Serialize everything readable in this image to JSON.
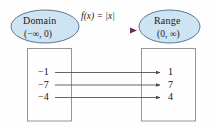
{
  "figure": {
    "type": "function-mapping-diagram",
    "background_color": "#fefefe",
    "domain_ellipse": {
      "title": "Domain",
      "interval": "(−∞, 0)",
      "fill_color": "#cfe4f3",
      "stroke_color": "#4a6a86"
    },
    "range_ellipse": {
      "title": "Range",
      "interval": "(0, ∞)",
      "fill_color": "#cfe4f3",
      "stroke_color": "#4a6a86"
    },
    "function_label": "f(x) = |x|",
    "function_label_parts": {
      "f": "f",
      "open_paren": "(",
      "variable": "x",
      "close_paren": ")",
      "equals": "=",
      "abs": "|x|"
    },
    "top_connector": {
      "from": "Domain",
      "to": "Range",
      "start_color": "#bcdcc0",
      "end_color": "#6b3050"
    },
    "left_box": {
      "stroke_color": "#8a8a8a",
      "values": [
        "−1",
        "−7",
        "−4"
      ]
    },
    "right_box": {
      "stroke_color": "#8a8a8a",
      "values": [
        "1",
        "7",
        "4"
      ]
    },
    "mappings": [
      {
        "input": "−1",
        "output": "1"
      },
      {
        "input": "−7",
        "output": "7"
      },
      {
        "input": "−4",
        "output": "4"
      }
    ],
    "arrow_color": "#555555"
  }
}
